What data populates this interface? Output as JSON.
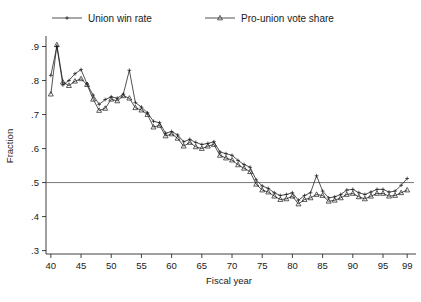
{
  "chart_data": {
    "type": "line",
    "title": "",
    "xlabel": "Fiscal year",
    "ylabel": "Fraction",
    "xlim": [
      39.2,
      99.8
    ],
    "ylim": [
      0.29,
      0.925
    ],
    "grid": false,
    "legend_position": "top",
    "x_ticks": [
      40,
      45,
      50,
      55,
      60,
      65,
      70,
      75,
      80,
      85,
      90,
      95,
      99
    ],
    "x_tick_labels": [
      "40",
      "45",
      "50",
      "55",
      "60",
      "65",
      "70",
      "75",
      "80",
      "85",
      "90",
      "95",
      "99"
    ],
    "y_ticks": [
      0.3,
      0.4,
      0.5,
      0.6,
      0.7,
      0.8,
      0.9
    ],
    "y_tick_labels": [
      ".3",
      ".4",
      ".5",
      ".6",
      ".7",
      ".8",
      ".9"
    ],
    "reference_line": {
      "y": 0.5,
      "label": ""
    },
    "x": [
      40,
      41,
      42,
      43,
      44,
      45,
      46,
      47,
      48,
      49,
      50,
      51,
      52,
      53,
      54,
      55,
      56,
      57,
      58,
      59,
      60,
      61,
      62,
      63,
      64,
      65,
      66,
      67,
      68,
      69,
      70,
      71,
      72,
      73,
      74,
      75,
      76,
      77,
      78,
      79,
      80,
      81,
      82,
      83,
      84,
      85,
      86,
      87,
      88,
      89,
      90,
      91,
      92,
      93,
      94,
      95,
      96,
      97,
      98,
      99
    ],
    "series": [
      {
        "name": "Union win rate",
        "marker": "plus",
        "color": "#1a1a1a",
        "values": [
          0.815,
          0.9,
          0.787,
          0.8,
          0.82,
          0.832,
          0.79,
          0.757,
          0.73,
          0.744,
          0.752,
          0.748,
          0.76,
          0.83,
          0.735,
          0.722,
          0.705,
          0.68,
          0.676,
          0.645,
          0.65,
          0.64,
          0.62,
          0.627,
          0.618,
          0.612,
          0.615,
          0.62,
          0.59,
          0.585,
          0.58,
          0.565,
          0.553,
          0.545,
          0.508,
          0.49,
          0.483,
          0.47,
          0.462,
          0.465,
          0.47,
          0.448,
          0.462,
          0.47,
          0.52,
          0.475,
          0.455,
          0.458,
          0.465,
          0.478,
          0.48,
          0.47,
          0.465,
          0.472,
          0.48,
          0.48,
          0.472,
          0.475,
          0.492,
          0.512
        ]
      },
      {
        "name": "Pro-union vote share",
        "marker": "triangle",
        "color": "#1a1a1a",
        "values": [
          0.76,
          0.905,
          0.795,
          0.785,
          0.798,
          0.805,
          0.788,
          0.745,
          0.712,
          0.718,
          0.745,
          0.74,
          0.755,
          0.748,
          0.72,
          0.713,
          0.7,
          0.663,
          0.668,
          0.637,
          0.643,
          0.63,
          0.607,
          0.618,
          0.605,
          0.6,
          0.607,
          0.612,
          0.58,
          0.572,
          0.566,
          0.552,
          0.542,
          0.532,
          0.495,
          0.478,
          0.472,
          0.46,
          0.45,
          0.452,
          0.46,
          0.437,
          0.45,
          0.455,
          0.465,
          0.462,
          0.445,
          0.448,
          0.455,
          0.465,
          0.468,
          0.458,
          0.452,
          0.46,
          0.468,
          0.468,
          0.46,
          0.462,
          0.47,
          0.478
        ]
      }
    ],
    "legend": [
      {
        "label": "Union win rate",
        "marker": "plus"
      },
      {
        "label": "Pro-union vote share",
        "marker": "triangle"
      }
    ]
  }
}
